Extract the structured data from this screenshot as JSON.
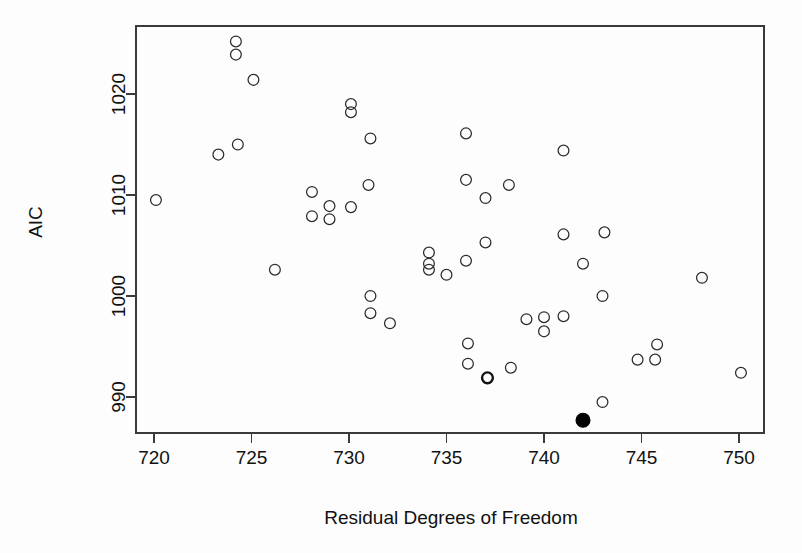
{
  "chart_data": {
    "type": "scatter",
    "title": "",
    "xlabel": "Residual Degrees of Freedom",
    "ylabel": "AIC",
    "xlim": [
      718.2,
      751.5
    ],
    "ylim": [
      986.3,
      1026.6
    ],
    "xticks": [
      720,
      725,
      730,
      735,
      740,
      745,
      750
    ],
    "yticks": [
      990,
      1000,
      1010,
      1020
    ],
    "xticklabels": [
      "720",
      "725",
      "730",
      "735",
      "740",
      "745",
      "750"
    ],
    "yticklabels": [
      "990",
      "1000",
      "1010",
      "1020"
    ],
    "grid": false,
    "legend": false,
    "marker_open_color": "#2b2b2b",
    "marker_filled_color": "#000000",
    "series": [
      {
        "name": "candidate models",
        "marker": "open-circle",
        "points": [
          {
            "x": 720.1,
            "y": 1009.5
          },
          {
            "x": 723.3,
            "y": 1014.0
          },
          {
            "x": 724.2,
            "y": 1025.2
          },
          {
            "x": 724.2,
            "y": 1023.9
          },
          {
            "x": 724.3,
            "y": 1015.0
          },
          {
            "x": 725.1,
            "y": 1021.4
          },
          {
            "x": 726.2,
            "y": 1002.6
          },
          {
            "x": 728.1,
            "y": 1010.3
          },
          {
            "x": 728.1,
            "y": 1007.9
          },
          {
            "x": 729.0,
            "y": 1008.9
          },
          {
            "x": 729.0,
            "y": 1007.6
          },
          {
            "x": 730.1,
            "y": 1019.0
          },
          {
            "x": 730.1,
            "y": 1018.2
          },
          {
            "x": 730.1,
            "y": 1008.8
          },
          {
            "x": 731.1,
            "y": 1015.6
          },
          {
            "x": 731.0,
            "y": 1011.0
          },
          {
            "x": 731.1,
            "y": 1000.0
          },
          {
            "x": 731.1,
            "y": 998.3
          },
          {
            "x": 732.1,
            "y": 997.3
          },
          {
            "x": 734.1,
            "y": 1004.3
          },
          {
            "x": 734.1,
            "y": 1003.2
          },
          {
            "x": 734.1,
            "y": 1002.6
          },
          {
            "x": 735.0,
            "y": 1002.1
          },
          {
            "x": 736.0,
            "y": 1016.1
          },
          {
            "x": 736.0,
            "y": 1011.5
          },
          {
            "x": 736.0,
            "y": 1003.5
          },
          {
            "x": 736.1,
            "y": 995.3
          },
          {
            "x": 736.1,
            "y": 993.3
          },
          {
            "x": 737.0,
            "y": 1009.7
          },
          {
            "x": 737.0,
            "y": 1005.3
          },
          {
            "x": 738.2,
            "y": 1011.0
          },
          {
            "x": 738.3,
            "y": 992.9
          },
          {
            "x": 739.1,
            "y": 997.7
          },
          {
            "x": 740.0,
            "y": 997.9
          },
          {
            "x": 740.0,
            "y": 996.5
          },
          {
            "x": 741.0,
            "y": 1014.4
          },
          {
            "x": 741.0,
            "y": 1006.1
          },
          {
            "x": 741.0,
            "y": 998.0
          },
          {
            "x": 742.0,
            "y": 1003.2
          },
          {
            "x": 743.1,
            "y": 1006.3
          },
          {
            "x": 743.0,
            "y": 1000.0
          },
          {
            "x": 743.0,
            "y": 989.5
          },
          {
            "x": 744.8,
            "y": 993.7
          },
          {
            "x": 745.8,
            "y": 995.2
          },
          {
            "x": 745.7,
            "y": 993.7
          },
          {
            "x": 748.1,
            "y": 1001.8
          },
          {
            "x": 750.1,
            "y": 992.4
          }
        ]
      },
      {
        "name": "overplotted model",
        "marker": "open-circle-bold",
        "points": [
          {
            "x": 737.1,
            "y": 991.9
          }
        ]
      },
      {
        "name": "selected model",
        "marker": "filled-circle",
        "points": [
          {
            "x": 742.0,
            "y": 987.7
          }
        ]
      }
    ]
  }
}
